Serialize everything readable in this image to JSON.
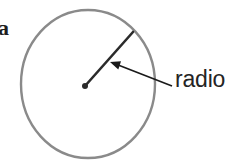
{
  "figure": {
    "background_color": "#ffffff",
    "circle": {
      "name": "circle-outline",
      "center_x": 88,
      "center_y": 84,
      "radius_x": 67,
      "radius_y": 74,
      "stroke_color": "#8a8a8a",
      "stroke_width": 2.4,
      "fill": "none"
    },
    "center_point": {
      "name": "center-dot",
      "x": 85,
      "y": 86,
      "radius": 3,
      "color": "#2b2b2b"
    },
    "radius_segment": {
      "name": "radius-line",
      "x1": 85,
      "y1": 86,
      "x2": 133,
      "y2": 32,
      "stroke_color": "#2b2b2b",
      "stroke_width": 2.6
    },
    "leader_arrow": {
      "name": "leader-arrow",
      "tail_x": 172,
      "tail_y": 86,
      "tip_x": 110,
      "tip_y": 62,
      "stroke_color": "#1a1a1a",
      "stroke_width": 1.6,
      "head_length": 11,
      "head_width": 7
    },
    "labels": {
      "radius_label": "radio",
      "partial_letter": "a"
    }
  }
}
